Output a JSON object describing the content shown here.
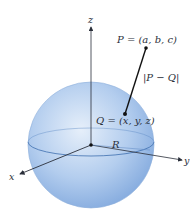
{
  "diagram": {
    "type": "3d-sphere-distance",
    "colors": {
      "sphere_light": "#dfeaf8",
      "sphere_mid": "#a9c6ea",
      "sphere_dark": "#6f9bd6",
      "axis": "#2a2f3a",
      "segment": "#111111",
      "equator": "#3d6fae"
    },
    "axes": {
      "x_label": "x",
      "y_label": "y",
      "z_label": "z"
    },
    "labels": {
      "P": "P = (a, b, c)",
      "Q": "Q = (x, y, z)",
      "distance": "|P − Q|",
      "radius": "R"
    }
  }
}
